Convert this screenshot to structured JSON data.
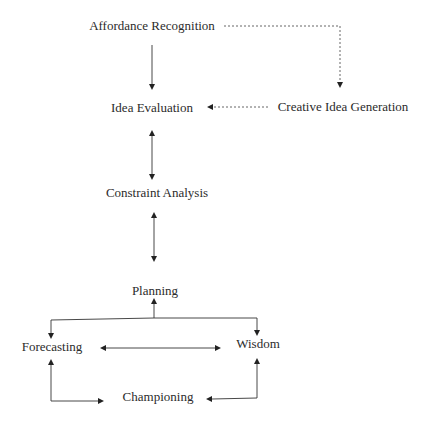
{
  "diagram": {
    "nodes": [
      {
        "id": "affordance",
        "label": "Affordance Recognition",
        "x": 152,
        "y": 30
      },
      {
        "id": "idea_eval",
        "label": "Idea Evaluation",
        "x": 152,
        "y": 112
      },
      {
        "id": "creative",
        "label": "Creative Idea Generation",
        "x": 343,
        "y": 111
      },
      {
        "id": "constraint",
        "label": "Constraint Analysis",
        "x": 157,
        "y": 197
      },
      {
        "id": "planning",
        "label": "Planning",
        "x": 155,
        "y": 295
      },
      {
        "id": "forecasting",
        "label": "Forecasting",
        "x": 52,
        "y": 351
      },
      {
        "id": "wisdom",
        "label": "Wisdom",
        "x": 258,
        "y": 348
      },
      {
        "id": "championing",
        "label": "Championing",
        "x": 158,
        "y": 401
      }
    ],
    "edges": [
      {
        "from": "affordance",
        "to": "idea_eval",
        "style": "solid",
        "direction": "forward"
      },
      {
        "from": "affordance",
        "to": "creative",
        "style": "dashed",
        "direction": "forward"
      },
      {
        "from": "creative",
        "to": "idea_eval",
        "style": "dashed",
        "direction": "forward"
      },
      {
        "from": "idea_eval",
        "to": "constraint",
        "style": "solid",
        "direction": "both"
      },
      {
        "from": "constraint",
        "to": "planning",
        "style": "solid",
        "direction": "both"
      },
      {
        "from": "forecasting",
        "to": "planning",
        "style": "solid",
        "direction": "both"
      },
      {
        "from": "wisdom",
        "to": "planning",
        "style": "solid",
        "direction": "both"
      },
      {
        "from": "forecasting",
        "to": "wisdom",
        "style": "solid",
        "direction": "both"
      },
      {
        "from": "forecasting",
        "to": "championing",
        "style": "solid",
        "direction": "both"
      },
      {
        "from": "wisdom",
        "to": "championing",
        "style": "solid",
        "direction": "both"
      }
    ]
  }
}
